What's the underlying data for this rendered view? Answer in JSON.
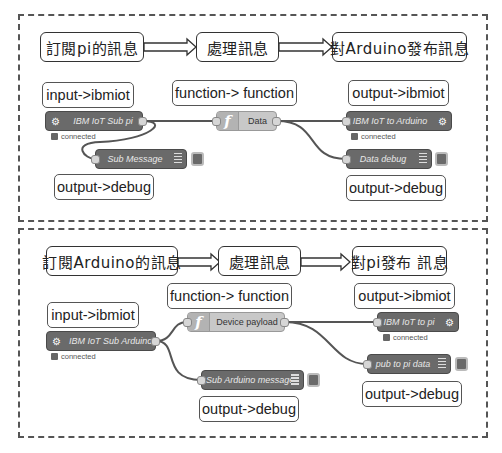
{
  "flows": [
    {
      "stages": [
        "訂閱pi的訊息",
        "處理訊息",
        "對Arduino發布訊息"
      ],
      "nodes": {
        "input": {
          "label": "IBM IoT Sub pi",
          "status": "connected",
          "callout": "input->ibmiot",
          "icon": "gear-icon"
        },
        "function": {
          "label": "Data",
          "callout": "function-> function",
          "icon": "function-icon"
        },
        "output": {
          "label": "IBM IoT to Arduino",
          "status": "connected",
          "callout": "output->ibmiot",
          "icon": "gear-icon"
        },
        "debug_a": {
          "label": "Sub Message",
          "callout": "output->debug",
          "icon": "list-icon"
        },
        "debug_b": {
          "label": "Data debug",
          "callout": "output->debug",
          "icon": "list-icon"
        }
      }
    },
    {
      "stages": [
        "訂閱Arduino的訊息",
        "處理訊息",
        "對pi發布 訊息"
      ],
      "nodes": {
        "input": {
          "label": "IBM IoT Sub Arduino",
          "status": "connected",
          "callout": "input->ibmiot",
          "icon": "gear-icon"
        },
        "function": {
          "label": "Device payload",
          "callout": "function-> function",
          "icon": "function-icon"
        },
        "output": {
          "label": "IBM IoT to pi",
          "status": "connected",
          "callout": "output->ibmiot",
          "icon": "gear-icon"
        },
        "debug_a": {
          "label": "Sub Arduino message",
          "callout": "output->debug",
          "icon": "list-icon"
        },
        "debug_b": {
          "label": "pub to pi data",
          "callout": "output->debug",
          "icon": "list-icon"
        }
      }
    }
  ],
  "colors": {
    "node_dark": "#6a6a6a",
    "node_function": "#c8c8c8",
    "wire": "#555555",
    "border": "#555555"
  }
}
